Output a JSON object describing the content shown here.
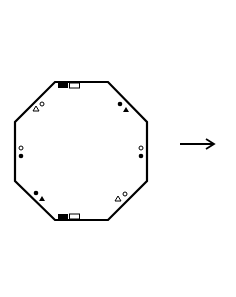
{
  "diagram": {
    "type": "octagon-with-markers",
    "colors": {
      "stroke": "#000000",
      "fill_dark": "#000000",
      "fill_light": "#ffffff",
      "background": "#ffffff"
    },
    "octagon": {
      "points": "55,82 108,82 147,122 147,181 108,220 55,220 15,181 15,122"
    },
    "edge_markers": [
      {
        "position": "top",
        "items": [
          "filled-rectangle",
          "open-rectangle"
        ]
      },
      {
        "position": "bottom",
        "items": [
          "filled-rectangle",
          "open-rectangle"
        ]
      }
    ],
    "corner_markers": [
      {
        "position": "top-left",
        "items": [
          "open-triangle",
          "open-circle"
        ]
      },
      {
        "position": "top-right",
        "items": [
          "filled-circle",
          "filled-triangle"
        ]
      },
      {
        "position": "left",
        "items": [
          "open-circle",
          "filled-circle"
        ]
      },
      {
        "position": "right",
        "items": [
          "open-circle",
          "filled-circle"
        ]
      },
      {
        "position": "bottom-left",
        "items": [
          "filled-circle",
          "filled-triangle"
        ]
      },
      {
        "position": "bottom-right",
        "items": [
          "open-triangle",
          "open-circle"
        ]
      }
    ],
    "arrow": {
      "direction": "right"
    }
  }
}
